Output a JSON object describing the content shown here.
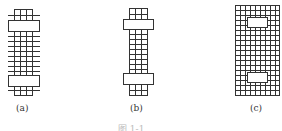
{
  "figures": [
    {
      "id": "a",
      "label": "(a)"
    },
    {
      "id": "b",
      "label": "(b)"
    },
    {
      "id": "c",
      "label": "(c)"
    }
  ],
  "caption": "图 1-1",
  "colors": {
    "stroke": "#333333",
    "background": "#ffffff"
  }
}
